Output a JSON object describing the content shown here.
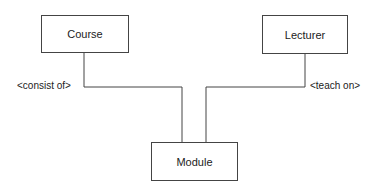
{
  "entities": {
    "course": {
      "label": "Course"
    },
    "lecturer": {
      "label": "Lecturer"
    },
    "module": {
      "label": "Module"
    }
  },
  "relationships": [
    {
      "from": "Course",
      "to": "Module",
      "label": "<consist of>"
    },
    {
      "from": "Lecturer",
      "to": "Module",
      "label": "<teach on>"
    }
  ]
}
